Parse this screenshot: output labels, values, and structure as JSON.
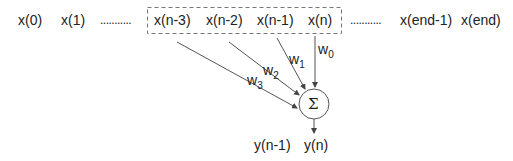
{
  "diagram": {
    "inputs": [
      "x(0)",
      "x(1)",
      "x(n-3)",
      "x(n-2)",
      "x(n-1)",
      "x(n)",
      "x(end-1)",
      "x(end)"
    ],
    "ellipsis": "...........",
    "weights": [
      {
        "base": "w",
        "sub": "0"
      },
      {
        "base": "w",
        "sub": "1"
      },
      {
        "base": "w",
        "sub": "2"
      },
      {
        "base": "w",
        "sub": "3"
      }
    ],
    "summation": "Σ",
    "outputs": [
      "y(n-1)",
      "y(n)"
    ],
    "colors": {
      "stroke": "#555555",
      "text": "#222222",
      "dash": "#777777"
    }
  }
}
